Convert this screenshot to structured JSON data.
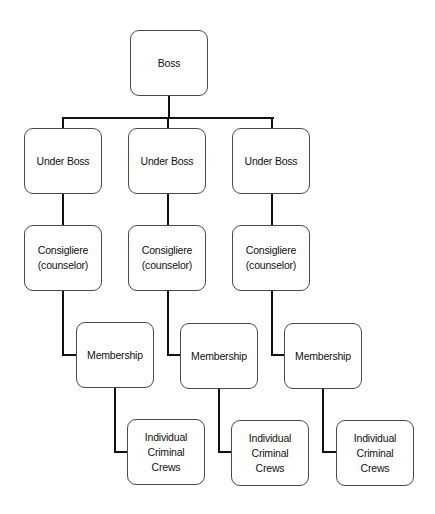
{
  "diagram": {
    "type": "org-chart",
    "root": {
      "label": "Boss"
    },
    "branches": [
      {
        "under_boss": "Under Boss",
        "consigliere": {
          "line1": "Consigliere",
          "line2": "(counselor)"
        },
        "membership": "Membership",
        "crews": {
          "line1": "Individual Criminal",
          "line2": "Crews"
        }
      },
      {
        "under_boss": "Under Boss",
        "consigliere": {
          "line1": "Consigliere",
          "line2": "(counselor)"
        },
        "membership": "Membership",
        "crews": {
          "line1": "Individual Criminal",
          "line2": "Crews"
        }
      },
      {
        "under_boss": "Under Boss",
        "consigliere": {
          "line1": "Consigliere",
          "line2": "(counselor)"
        },
        "membership": "Membership",
        "crews": {
          "line1": "Individual Criminal",
          "line2": "Crews"
        }
      }
    ],
    "colors": {
      "line": "#111111",
      "border": "#4a4a4a",
      "background": "#ffffff"
    }
  }
}
